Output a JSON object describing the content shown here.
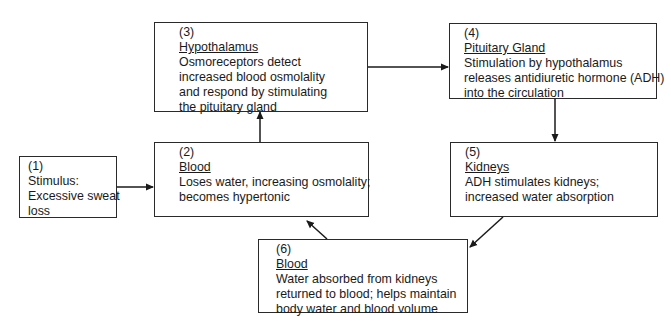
{
  "diagram": {
    "type": "flowchart",
    "topic": "Negative feedback regulation of blood osmolality via ADH",
    "nodes": [
      {
        "id": "1",
        "number": "(1)",
        "title": "",
        "lines": [
          "Stimulus:",
          "Excessive sweat",
          "loss"
        ]
      },
      {
        "id": "2",
        "number": "(2)",
        "title": "Blood",
        "lines": [
          "Loses water, increasing osmolality;",
          "becomes hypertonic"
        ]
      },
      {
        "id": "3",
        "number": "(3)",
        "title": "Hypothalamus",
        "lines": [
          "Osmoreceptors detect",
          "increased blood osmolality",
          "and respond by stimulating",
          "the pituitary gland"
        ]
      },
      {
        "id": "4",
        "number": "(4)",
        "title": "Pituitary Gland",
        "lines": [
          "Stimulation by hypothalamus",
          "releases antidiuretic hormone (ADH)",
          "into the circulation"
        ]
      },
      {
        "id": "5",
        "number": "(5)",
        "title": "Kidneys",
        "lines": [
          "ADH stimulates kidneys;",
          "increased water absorption"
        ]
      },
      {
        "id": "6",
        "number": "(6)",
        "title": "Blood",
        "lines": [
          "Water absorbed from kidneys",
          "returned to blood; helps maintain",
          "body water and blood volume"
        ]
      }
    ],
    "edges": [
      {
        "from": "1",
        "to": "2"
      },
      {
        "from": "2",
        "to": "3"
      },
      {
        "from": "3",
        "to": "4"
      },
      {
        "from": "4",
        "to": "5"
      },
      {
        "from": "5",
        "to": "6"
      },
      {
        "from": "6",
        "to": "2"
      }
    ],
    "colors": {
      "stroke": "#2a2a2a",
      "text": "#1a1a1a",
      "background": "#ffffff"
    }
  }
}
